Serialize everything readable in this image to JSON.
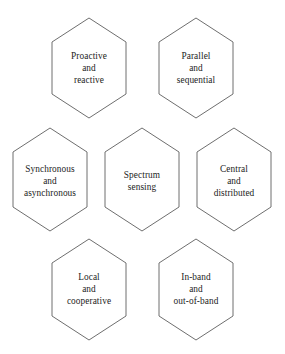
{
  "diagram": {
    "type": "hexagon-honeycomb",
    "background_color": "#ffffff",
    "stroke_color": "#5d5d5d",
    "text_color": "#1c1c1c",
    "rows": [
      2,
      3,
      2
    ],
    "cells": [
      {
        "id": "proactive-reactive",
        "lines": "Proactive\nand\nreactive",
        "row": 1,
        "col": 1,
        "center_x": 89,
        "center_y": 68
      },
      {
        "id": "parallel-sequential",
        "lines": "Parallel\nand\nsequential",
        "row": 1,
        "col": 2,
        "center_x": 196,
        "center_y": 68
      },
      {
        "id": "synchronous-asynchronous",
        "lines": "Synchronous\nand\nasynchronous",
        "row": 2,
        "col": 1,
        "center_x": 50,
        "center_y": 181
      },
      {
        "id": "spectrum-sensing",
        "lines": "Spectrum\nsensing",
        "row": 2,
        "col": 2,
        "center_x": 142,
        "center_y": 181
      },
      {
        "id": "central-distributed",
        "lines": "Central\nand\ndistributed",
        "row": 2,
        "col": 3,
        "center_x": 234,
        "center_y": 181
      },
      {
        "id": "local-cooperative",
        "lines": "Local\nand\ncooperative",
        "row": 3,
        "col": 1,
        "center_x": 89,
        "center_y": 289
      },
      {
        "id": "in-band-out-of-band",
        "lines": "In-band\nand\nout-of-band",
        "row": 3,
        "col": 2,
        "center_x": 196,
        "center_y": 289
      }
    ]
  }
}
